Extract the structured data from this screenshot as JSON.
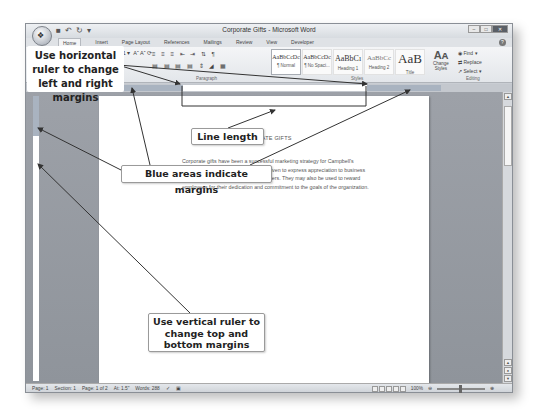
{
  "window": {
    "title": "Corporate Gifts - Microsoft Word",
    "controls": [
      "minimize",
      "maximize",
      "close"
    ]
  },
  "quick_access": {
    "save_icon": "save-icon",
    "undo_icon": "undo-icon",
    "redo_icon": "redo-icon",
    "customize_icon": "customize-icon"
  },
  "tabs": [
    {
      "label": "Home",
      "active": true
    },
    {
      "label": "Insert"
    },
    {
      "label": "Page Layout"
    },
    {
      "label": "References"
    },
    {
      "label": "Mailings"
    },
    {
      "label": "Review"
    },
    {
      "label": "View"
    },
    {
      "label": "Developer"
    }
  ],
  "ribbon": {
    "font_size": "11",
    "groups": {
      "font": "Font",
      "paragraph": "Paragraph",
      "styles": "Styles",
      "editing": "Editing"
    },
    "styles": [
      {
        "preview": "AaBbCcDc",
        "name": "¶ Normal",
        "selected": true
      },
      {
        "preview": "AaBbCcDc",
        "name": "¶ No Spaci..."
      },
      {
        "preview": "AaBbCı",
        "name": "Heading 1"
      },
      {
        "preview": "AaBbCc",
        "name": "Heading 2"
      },
      {
        "preview": "AaB",
        "name": "Title"
      }
    ],
    "change_styles": "Change Styles",
    "editing_items": [
      "Find",
      "Replace",
      "Select"
    ]
  },
  "document": {
    "heading": "CORPORATE GIFTS",
    "body": "Corporate gifts have been a successful marketing strategy for Campbell's Confections. Corporate gifts may be given to express appreciation to business associates, clients, patrons, or customers. They may also be used to reward employees for their dedication and commitment to the goals of the organization."
  },
  "status_bar": {
    "page": "Page: 1",
    "section": "Section: 1",
    "page_of": "Page: 1 of 2",
    "at": "At: 1.5\"",
    "words": "Words: 288",
    "zoom": "100%"
  },
  "callouts": {
    "horizontal_ruler": "Use horizontal ruler to change left and right margins",
    "line_length": "Line length",
    "blue_areas": "Blue areas indicate margins",
    "vertical_ruler": "Use vertical ruler to change top and bottom margins"
  }
}
